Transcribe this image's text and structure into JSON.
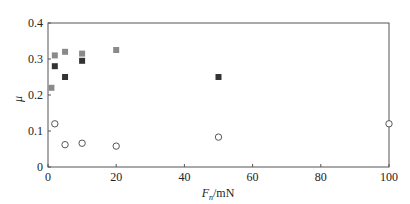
{
  "chart_data": {
    "type": "scatter",
    "title": "",
    "xlabel": "F_n/mN",
    "xlabel_main": "F",
    "xlabel_sub": "n",
    "xlabel_unit": "/mN",
    "ylabel": "μ",
    "xlim": [
      0,
      100
    ],
    "ylim": [
      0,
      0.4
    ],
    "x_ticks": [
      0,
      20,
      40,
      60,
      80,
      100
    ],
    "x_tick_labels": [
      "0",
      "20",
      "40",
      "60",
      "80",
      "100"
    ],
    "y_ticks": [
      0,
      0.1,
      0.2,
      0.3,
      0.4
    ],
    "y_tick_labels": [
      "0",
      "0.1",
      "0.2",
      "0.3",
      "0.4"
    ],
    "grid": false,
    "legend": null,
    "series": [
      {
        "name": "series-light-square",
        "marker": "square",
        "color": "#8a8a8a",
        "points": [
          [
            1,
            0.22
          ],
          [
            2,
            0.31
          ],
          [
            5,
            0.32
          ],
          [
            10,
            0.315
          ],
          [
            20,
            0.325
          ]
        ]
      },
      {
        "name": "series-dark-square",
        "marker": "square",
        "color": "#333333",
        "points": [
          [
            2,
            0.28
          ],
          [
            5,
            0.25
          ],
          [
            10,
            0.295
          ],
          [
            50,
            0.25
          ]
        ]
      },
      {
        "name": "series-open-circle",
        "marker": "circle-open",
        "color": "#555555",
        "points": [
          [
            2,
            0.12
          ],
          [
            5,
            0.062
          ],
          [
            10,
            0.066
          ],
          [
            20,
            0.058
          ],
          [
            50,
            0.083
          ],
          [
            100,
            0.12
          ]
        ]
      }
    ]
  }
}
